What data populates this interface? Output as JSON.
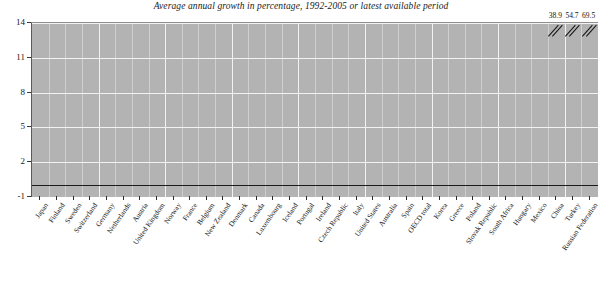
{
  "chart_data": {
    "type": "bar",
    "title": "Average annual growth in percentage, 1992-2005 or latest available period",
    "xlabel": "",
    "ylabel": "",
    "ylim": [
      -1,
      14
    ],
    "yticks": [
      -1,
      2,
      5,
      8,
      11,
      14
    ],
    "ytick_labels": [
      "-1",
      "2",
      "5",
      "8",
      "11",
      "14"
    ],
    "grid": true,
    "legend": "none",
    "axis_break": true,
    "axis_break_note": "Last three bars exceed the axis maximum and are drawn truncated with break marks; their true values are printed above the plot.",
    "highlight_category": "OECD total",
    "categories": [
      "Japan",
      "Finland",
      "Sweden",
      "Switzerland",
      "Germany",
      "Netherlands",
      "Austria",
      "United Kingdom",
      "Norway",
      "France",
      "Belgium",
      "New Zealand",
      "Denmark",
      "Canada",
      "Luxembourg",
      "Iceland",
      "Portugal",
      "Ireland",
      "Czech Republic",
      "Italy",
      "United States",
      "Australia",
      "Spain",
      "OECD total",
      "Korea",
      "Greece",
      "Poland",
      "Slovak Republic",
      "South Africa",
      "Hungary",
      "Mexico",
      "China",
      "Turkey",
      "Russian Federation"
    ],
    "values": [
      -0.2,
      0.3,
      0.6,
      0.8,
      0.9,
      1.1,
      1.2,
      1.3,
      1.4,
      1.5,
      1.6,
      1.6,
      1.7,
      1.8,
      1.9,
      2.0,
      2.2,
      2.3,
      2.4,
      2.5,
      2.6,
      2.7,
      2.8,
      3.2,
      3.6,
      4.2,
      4.8,
      5.6,
      6.3,
      6.7,
      12.9,
      38.9,
      54.7,
      69.5
    ],
    "displayed_top_labels": [
      {
        "category": "China",
        "value": "38.9"
      },
      {
        "category": "Turkey",
        "value": "54.7"
      },
      {
        "category": "Russian Federation",
        "value": "69.5"
      }
    ],
    "colors": {
      "bar": "#8c8c8c",
      "highlight_bar": "#2e2e2e",
      "plot_background": "#b3b3b3",
      "gridline": "#f2f2f2",
      "axis": "#1c1c1c",
      "text": "#141414",
      "page_background": "#ffffff"
    }
  }
}
